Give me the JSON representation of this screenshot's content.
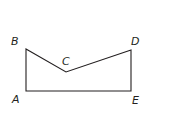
{
  "diagram": {
    "type": "polygon",
    "stroke_color": "#231f20",
    "vertices": [
      {
        "label": "A",
        "x": 26,
        "y": 91
      },
      {
        "label": "B",
        "x": 26,
        "y": 49
      },
      {
        "label": "C",
        "x": 66,
        "y": 72
      },
      {
        "label": "D",
        "x": 131,
        "y": 50
      },
      {
        "label": "E",
        "x": 131,
        "y": 91
      }
    ],
    "labels": {
      "A": "A",
      "B": "B",
      "C": "C",
      "D": "D",
      "E": "E"
    }
  }
}
